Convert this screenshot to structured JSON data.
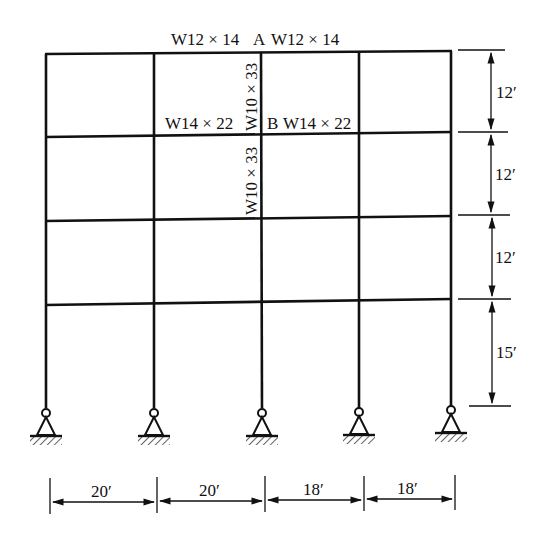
{
  "frame": {
    "title": "Four-bay, four-story rigid frame",
    "labels": {
      "roof_beam_left": "W12 × 14",
      "joint_a": "A",
      "roof_beam_right": "W12 × 14",
      "column_upper": "W10 × 33",
      "floor_beam_left": "W14 × 22",
      "joint_b": "B",
      "floor_beam_right": "W14 × 22",
      "column_lower": "W10 × 33"
    },
    "story_heights": [
      "12′",
      "12′",
      "12′",
      "15′"
    ],
    "bay_widths": [
      "20′",
      "20′",
      "18′",
      "18′"
    ],
    "supports": [
      "pin",
      "pin",
      "pin",
      "pin",
      "pin"
    ]
  }
}
